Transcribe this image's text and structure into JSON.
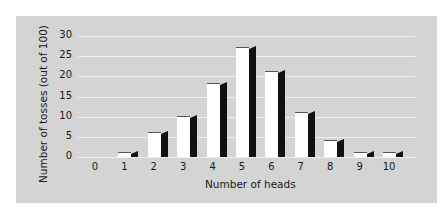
{
  "chart_data": {
    "type": "bar",
    "title": "",
    "xlabel": "Number of heads",
    "ylabel": "Number of tosses (out of 100)",
    "categories": [
      "0",
      "1",
      "2",
      "3",
      "4",
      "5",
      "6",
      "7",
      "8",
      "9",
      "10"
    ],
    "values": [
      0,
      1,
      6,
      10,
      18,
      27,
      21,
      11,
      4,
      1,
      1
    ],
    "ylim": [
      0,
      30
    ],
    "yticks": [
      "0",
      "5",
      "10",
      "15",
      "20",
      "25",
      "30"
    ],
    "grid": true,
    "legend": null,
    "style": "3d-bar white face with black side"
  }
}
